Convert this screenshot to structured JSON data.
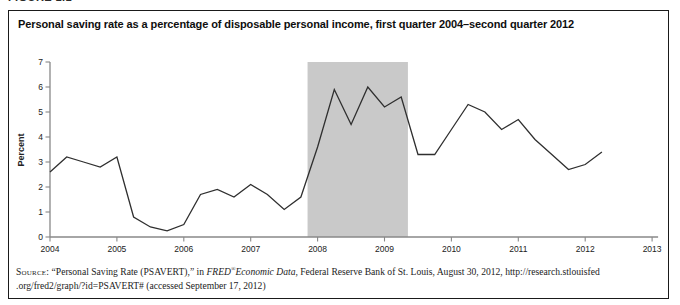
{
  "figure_label": "FIGURE 1.1",
  "figure": {
    "title": "Personal saving rate as a percentage of disposable personal income, first quarter 2004–second quarter 2012"
  },
  "chart_data": {
    "type": "line",
    "title": "Personal saving rate as a percentage of disposable personal income, first quarter 2004–second quarter 2012",
    "xlabel": "",
    "ylabel": "Percent",
    "ylim": [
      0,
      7
    ],
    "yticks": [
      0,
      1,
      2,
      3,
      4,
      5,
      6,
      7
    ],
    "xlim": [
      2004,
      2013
    ],
    "xticks": [
      2004,
      2005,
      2006,
      2007,
      2008,
      2009,
      2010,
      2011,
      2012,
      2013
    ],
    "xtick_labels": [
      "2004",
      "2005",
      "2006",
      "2007",
      "2008",
      "2009",
      "2010",
      "2011",
      "2012",
      "2013"
    ],
    "grid": false,
    "legend": "none",
    "recession_band": {
      "start": 2007.85,
      "end": 2009.35,
      "color": "#c9c9c9"
    },
    "line_color": "#2f2f2f",
    "axis_color": "#888888",
    "x": [
      2004.0,
      2004.25,
      2004.5,
      2004.75,
      2005.0,
      2005.25,
      2005.5,
      2005.75,
      2006.0,
      2006.25,
      2006.5,
      2006.75,
      2007.0,
      2007.25,
      2007.5,
      2007.75,
      2008.0,
      2008.25,
      2008.5,
      2008.75,
      2009.0,
      2009.25,
      2009.5,
      2009.75,
      2010.0,
      2010.25,
      2010.5,
      2010.75,
      2011.0,
      2011.25,
      2011.5,
      2011.75,
      2012.0,
      2012.25
    ],
    "values": [
      2.6,
      3.2,
      3.0,
      2.8,
      3.2,
      0.8,
      0.4,
      0.25,
      0.5,
      1.7,
      1.9,
      1.6,
      2.1,
      1.7,
      1.1,
      1.6,
      3.6,
      5.9,
      4.5,
      6.0,
      5.2,
      5.6,
      3.3,
      3.3,
      4.3,
      5.3,
      5.0,
      4.3,
      4.7,
      3.9,
      3.3,
      2.7,
      2.9,
      3.4
    ]
  },
  "source": {
    "label": "Source:",
    "seg1": " “Personal Saving Rate (PSAVERT),” in ",
    "fred": "FRED",
    "reg": "®",
    "econ": "Economic Data",
    "seg2": ", Federal Reserve Bank of St. Louis, August 30, 2012, http://research.stlouisfed",
    "line2": ".org/fred2/graph/?id=PSAVERT# (accessed September 17, 2012)"
  }
}
